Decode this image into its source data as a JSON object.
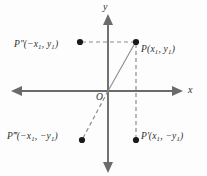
{
  "figure": {
    "axes": {
      "x_label": "x",
      "y_label": "y",
      "origin_label": "O"
    },
    "points": [
      {
        "key": "P",
        "name": "point-p",
        "label_full": "P(x1, y1)",
        "base": "P",
        "prime": "",
        "coord_x": "x",
        "coord_x_sub": "1",
        "coord_y": "y",
        "coord_y_sub": "1",
        "x_sign": "",
        "y_sign": "",
        "px": 136,
        "py": 42
      },
      {
        "key": "P2",
        "name": "point-p-double-prime",
        "label_full": "P″(−x1, y1)",
        "base": "P",
        "prime": "″",
        "coord_x": "x",
        "coord_x_sub": "1",
        "coord_y": "y",
        "coord_y_sub": "1",
        "x_sign": "−",
        "y_sign": "",
        "px": 80,
        "py": 42
      },
      {
        "key": "P1",
        "name": "point-p-prime",
        "label_full": "P′(x1, −y1)",
        "base": "P",
        "prime": "′",
        "coord_x": "x",
        "coord_x_sub": "1",
        "coord_y": "y",
        "coord_y_sub": "1",
        "x_sign": "",
        "y_sign": "−",
        "px": 136,
        "py": 140
      },
      {
        "key": "P3",
        "name": "point-p-triple-prime",
        "label_full": "P‴(−x1, −y1)",
        "base": "P",
        "prime": "‴",
        "coord_x": "x",
        "coord_x_sub": "1",
        "coord_y": "y",
        "coord_y_sub": "1",
        "x_sign": "−",
        "y_sign": "−",
        "px": 82,
        "py": 140
      }
    ],
    "colors": {
      "axis": "#6b6b6b",
      "dash": "#8c8c8c",
      "solid_connector": "#8c8c8c",
      "dot": "#1a1a1a",
      "text": "#2e2e2e",
      "background": "#fdfdfd"
    }
  }
}
